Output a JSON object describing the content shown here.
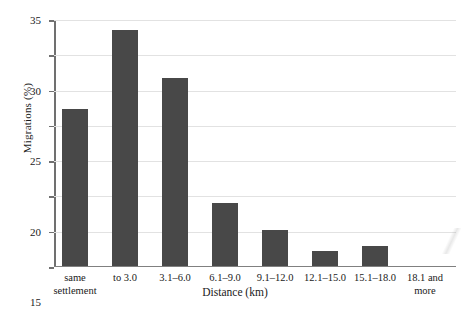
{
  "chart_data": {
    "type": "bar",
    "title": "",
    "xlabel": "Distance (km)",
    "ylabel": "Migrations (%)",
    "categories": [
      "same\nsettlement",
      "to 3.0",
      "3.1–6.0",
      "6.1–9.0",
      "9.1–12.0",
      "12.1–15.0",
      "15.1–18.0",
      "18.1 and\nmore"
    ],
    "values": [
      22.2,
      33.4,
      26.6,
      8.8,
      5.0,
      2.1,
      2.7,
      0
    ],
    "ylim": [
      0,
      35
    ],
    "yticks": [
      0,
      5,
      10,
      15,
      20,
      25,
      30,
      35
    ],
    "ytick_labels": [
      "0",
      "5",
      "10",
      "15",
      "20",
      "25",
      "30",
      "35"
    ],
    "grid": true,
    "legend": "none",
    "bar_color": "#484848",
    "gridline_color": "#e2e2e2",
    "axis_color": "#707070"
  }
}
